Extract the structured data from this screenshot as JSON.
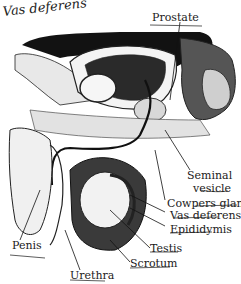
{
  "diagram": {
    "handwritten_note": "Vas deferens",
    "labels": [
      {
        "id": "prostate",
        "text": "Prostate"
      },
      {
        "id": "seminal-vesicle-1",
        "text": "Seminal"
      },
      {
        "id": "seminal-vesicle-2",
        "text": "vesicle"
      },
      {
        "id": "cowpers-gland",
        "text": "Cowpers gland"
      },
      {
        "id": "vas-deferens",
        "text": "Vas deferens"
      },
      {
        "id": "epididymis",
        "text": "Epididymis"
      },
      {
        "id": "testis",
        "text": "Testis"
      },
      {
        "id": "scrotum",
        "text": "Scrotum"
      },
      {
        "id": "urethra",
        "text": "Urethra"
      },
      {
        "id": "penis",
        "text": "Penis"
      }
    ],
    "colors": {
      "ink": "#1a1a1a",
      "background": "#ffffff",
      "shade": "#6e6e6e",
      "dark": "#101010"
    }
  }
}
